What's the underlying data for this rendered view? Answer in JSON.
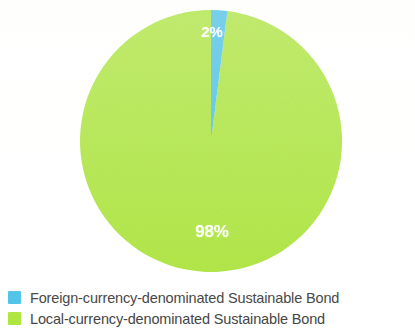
{
  "figure": {
    "background_color": "#ffffff"
  },
  "chart_data": {
    "type": "pie",
    "title": "",
    "subtitle": "",
    "xlabel": "",
    "ylabel": "",
    "grid": false,
    "legend_position": "bottom-left",
    "start_angle_deg": 0,
    "direction": "clockwise",
    "categories": [
      "Foreign-currency-denominated Sustainable Bond",
      "Local-currency-denominated Sustainable Bond"
    ],
    "values": [
      2,
      98
    ],
    "value_unit": "%",
    "data_labels": [
      "2%",
      "98%"
    ],
    "colors": [
      "#4FC3E8",
      "#AEE640"
    ],
    "slices": [
      {
        "name": "Foreign-currency-denominated Sustainable Bond",
        "value": 2,
        "label": "2%",
        "color": "#4FC3E8"
      },
      {
        "name": "Local-currency-denominated Sustainable Bond",
        "value": 98,
        "label": "98%",
        "color": "#AEE640"
      }
    ]
  },
  "pie": {
    "labels": {
      "foreign": "2%",
      "local": "98%"
    },
    "label_color": "#ffffff"
  },
  "legend": {
    "items": [
      {
        "label": "Foreign-currency-denominated Sustainable Bond",
        "color": "#4FC3E8"
      },
      {
        "label": "Local-currency-denominated Sustainable Bond",
        "color": "#AEE640"
      }
    ]
  }
}
